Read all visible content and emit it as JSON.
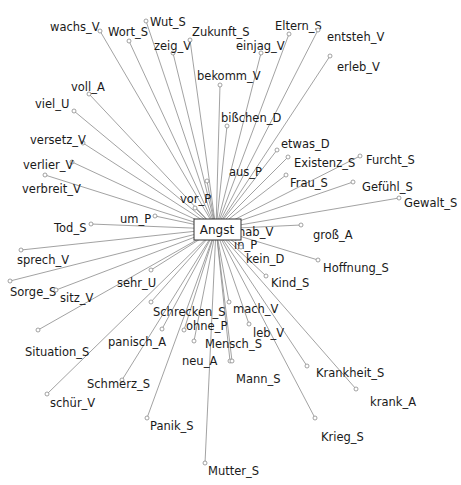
{
  "diagram": {
    "type": "collocation-network",
    "center": {
      "label": "Angst",
      "x": 216,
      "y": 229
    },
    "nodes": [
      {
        "label": "wachs_V",
        "dx": 100,
        "dy": 31,
        "lx": 50,
        "ly": 27
      },
      {
        "label": "Wort_S",
        "dx": 129,
        "dy": 41,
        "lx": 108,
        "ly": 32
      },
      {
        "label": "Wut_S",
        "dx": 146,
        "dy": 21,
        "lx": 150,
        "ly": 22
      },
      {
        "label": "zeig_V",
        "dx": 173,
        "dy": 53,
        "lx": 154,
        "ly": 46
      },
      {
        "label": "Zukunft_S",
        "dx": 190,
        "dy": 40,
        "lx": 192,
        "ly": 32
      },
      {
        "label": "bekomm_V",
        "dx": 220,
        "dy": 85,
        "lx": 197,
        "ly": 76
      },
      {
        "label": "einjag_V",
        "dx": 261,
        "dy": 53,
        "lx": 236,
        "ly": 46
      },
      {
        "label": "Eltern_S",
        "dx": 289,
        "dy": 34,
        "lx": 275,
        "ly": 26
      },
      {
        "label": "entsteh_V",
        "dx": 318,
        "dy": 30,
        "lx": 327,
        "ly": 37
      },
      {
        "label": "erleb_V",
        "dx": 330,
        "dy": 56,
        "lx": 337,
        "ly": 67
      },
      {
        "label": "voll_A",
        "dx": 89,
        "dy": 94,
        "lx": 71,
        "ly": 87
      },
      {
        "label": "viel_U",
        "dx": 74,
        "dy": 111,
        "lx": 35,
        "ly": 104
      },
      {
        "label": "bißchen_D",
        "dx": 227,
        "dy": 126,
        "lx": 221,
        "ly": 118
      },
      {
        "label": "versetz_V",
        "dx": 83,
        "dy": 143,
        "lx": 30,
        "ly": 140
      },
      {
        "label": "verlier_V",
        "dx": 72,
        "dy": 162,
        "lx": 23,
        "ly": 165
      },
      {
        "label": "verbreit_V",
        "dx": 45,
        "dy": 175,
        "lx": 22,
        "ly": 189
      },
      {
        "label": "etwas_D",
        "dx": 277,
        "dy": 150,
        "lx": 281,
        "ly": 144
      },
      {
        "label": "Existenz_S",
        "dx": 288,
        "dy": 157,
        "lx": 294,
        "ly": 163
      },
      {
        "label": "Furcht_S",
        "dx": 360,
        "dy": 156,
        "lx": 366,
        "ly": 160
      },
      {
        "label": "aus_P",
        "dx": 207,
        "dy": 181,
        "lx": 229,
        "ly": 172
      },
      {
        "label": "Frau_S",
        "dx": 286,
        "dy": 175,
        "lx": 290,
        "ly": 183
      },
      {
        "label": "Gefühl_S",
        "dx": 353,
        "dy": 182,
        "lx": 362,
        "ly": 187
      },
      {
        "label": "vor_P",
        "dx": 195,
        "dy": 208,
        "lx": 180,
        "ly": 199
      },
      {
        "label": "Gewalt_S",
        "dx": 399,
        "dy": 198,
        "lx": 404,
        "ly": 203
      },
      {
        "label": "um_P",
        "dx": 155,
        "dy": 216,
        "lx": 120,
        "ly": 219
      },
      {
        "label": "Tod_S",
        "dx": 91,
        "dy": 224,
        "lx": 54,
        "ly": 228
      },
      {
        "label": "hab_V",
        "dx": 233,
        "dy": 228,
        "lx": 238,
        "ly": 232
      },
      {
        "label": "groß_A",
        "dx": 301,
        "dy": 225,
        "lx": 313,
        "ly": 235
      },
      {
        "label": "in_P",
        "dx": 232,
        "dy": 237,
        "lx": 234,
        "ly": 245
      },
      {
        "label": "kein_D",
        "dx": 241,
        "dy": 247,
        "lx": 246,
        "ly": 259
      },
      {
        "label": "Hoffnung_S",
        "dx": 318,
        "dy": 260,
        "lx": 323,
        "ly": 268
      },
      {
        "label": "sprech_V",
        "dx": 21,
        "dy": 250,
        "lx": 17,
        "ly": 260
      },
      {
        "label": "Kind_S",
        "dx": 266,
        "dy": 276,
        "lx": 271,
        "ly": 283
      },
      {
        "label": "Sorge_S",
        "dx": 10,
        "dy": 281,
        "lx": 10,
        "ly": 292
      },
      {
        "label": "sitz_V",
        "dx": 56,
        "dy": 290,
        "lx": 60,
        "ly": 298
      },
      {
        "label": "sehr_U",
        "dx": 151,
        "dy": 270,
        "lx": 117,
        "ly": 283
      },
      {
        "label": "Situation_S",
        "dx": 38,
        "dy": 330,
        "lx": 25,
        "ly": 352
      },
      {
        "label": "Schrecken_S",
        "dx": 151,
        "dy": 302,
        "lx": 153,
        "ly": 312
      },
      {
        "label": "mach_V",
        "dx": 229,
        "dy": 302,
        "lx": 233,
        "ly": 309
      },
      {
        "label": "ohne_P",
        "dx": 184,
        "dy": 330,
        "lx": 186,
        "ly": 326
      },
      {
        "label": "leb_V",
        "dx": 249,
        "dy": 324,
        "lx": 253,
        "ly": 333
      },
      {
        "label": "panisch_A",
        "dx": 162,
        "dy": 329,
        "lx": 108,
        "ly": 342
      },
      {
        "label": "Mensch_S",
        "dx": 194,
        "dy": 341,
        "lx": 205,
        "ly": 344
      },
      {
        "label": "neu_A",
        "dx": 230,
        "dy": 361,
        "lx": 182,
        "ly": 361
      },
      {
        "label": "Mann_S",
        "dx": 232,
        "dy": 361,
        "lx": 236,
        "ly": 379
      },
      {
        "label": "Krankheit_S",
        "dx": 307,
        "dy": 366,
        "lx": 316,
        "ly": 373
      },
      {
        "label": "Schmerz_S",
        "dx": 122,
        "dy": 380,
        "lx": 87,
        "ly": 384
      },
      {
        "label": "krank_A",
        "dx": 356,
        "dy": 389,
        "lx": 370,
        "ly": 402
      },
      {
        "label": "schür_V",
        "dx": 47,
        "dy": 394,
        "lx": 50,
        "ly": 403
      },
      {
        "label": "Panik_S",
        "dx": 147,
        "dy": 418,
        "lx": 150,
        "ly": 426
      },
      {
        "label": "Krieg_S",
        "dx": 315,
        "dy": 418,
        "lx": 321,
        "ly": 437
      },
      {
        "label": "Mutter_S",
        "dx": 205,
        "dy": 463,
        "lx": 208,
        "ly": 471
      }
    ]
  }
}
